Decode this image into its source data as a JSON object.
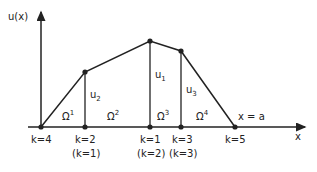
{
  "diagram": {
    "y_axis_label": "u(x)",
    "x_axis_label": "x",
    "boundary_label": "x = a",
    "nodes": [
      {
        "k": "k=4",
        "alt": "",
        "x": 41,
        "y": 127
      },
      {
        "k": "k=2",
        "alt": "(k=1)",
        "x": 85,
        "y": 72
      },
      {
        "k": "k=1",
        "alt": "(k=2)",
        "x": 150,
        "y": 41
      },
      {
        "k": "k=3",
        "alt": "(k=3)",
        "x": 181,
        "y": 51
      },
      {
        "k": "k=5",
        "alt": "",
        "x": 235,
        "y": 127
      }
    ],
    "values": [
      {
        "name": "u",
        "sub": "2"
      },
      {
        "name": "u",
        "sub": "1"
      },
      {
        "name": "u",
        "sub": "3"
      }
    ],
    "elements": [
      {
        "name": "Ω",
        "sup": "1"
      },
      {
        "name": "Ω",
        "sup": "2"
      },
      {
        "name": "Ω",
        "sup": "3"
      },
      {
        "name": "Ω",
        "sup": "4"
      }
    ]
  }
}
